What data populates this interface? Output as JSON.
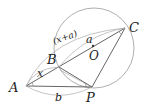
{
  "diagram": {
    "title": "",
    "points": {
      "A": {
        "label": "A",
        "x": 26,
        "y": 86
      },
      "B": {
        "label": "B",
        "x": 59,
        "y": 67
      },
      "C": {
        "label": "C",
        "x": 125,
        "y": 28
      },
      "P": {
        "label": "P",
        "x": 92,
        "y": 87
      },
      "O": {
        "label": "O",
        "x": 93,
        "y": 47
      }
    },
    "circle": {
      "cx": 94,
      "cy": 48,
      "r": 40
    },
    "lengths": {
      "AB": "x",
      "BC": "a",
      "AC": "(x+a)",
      "AP": "b"
    },
    "colors": {
      "line": "#555555",
      "circle": "#9a9a9a",
      "text": "#222222"
    }
  }
}
